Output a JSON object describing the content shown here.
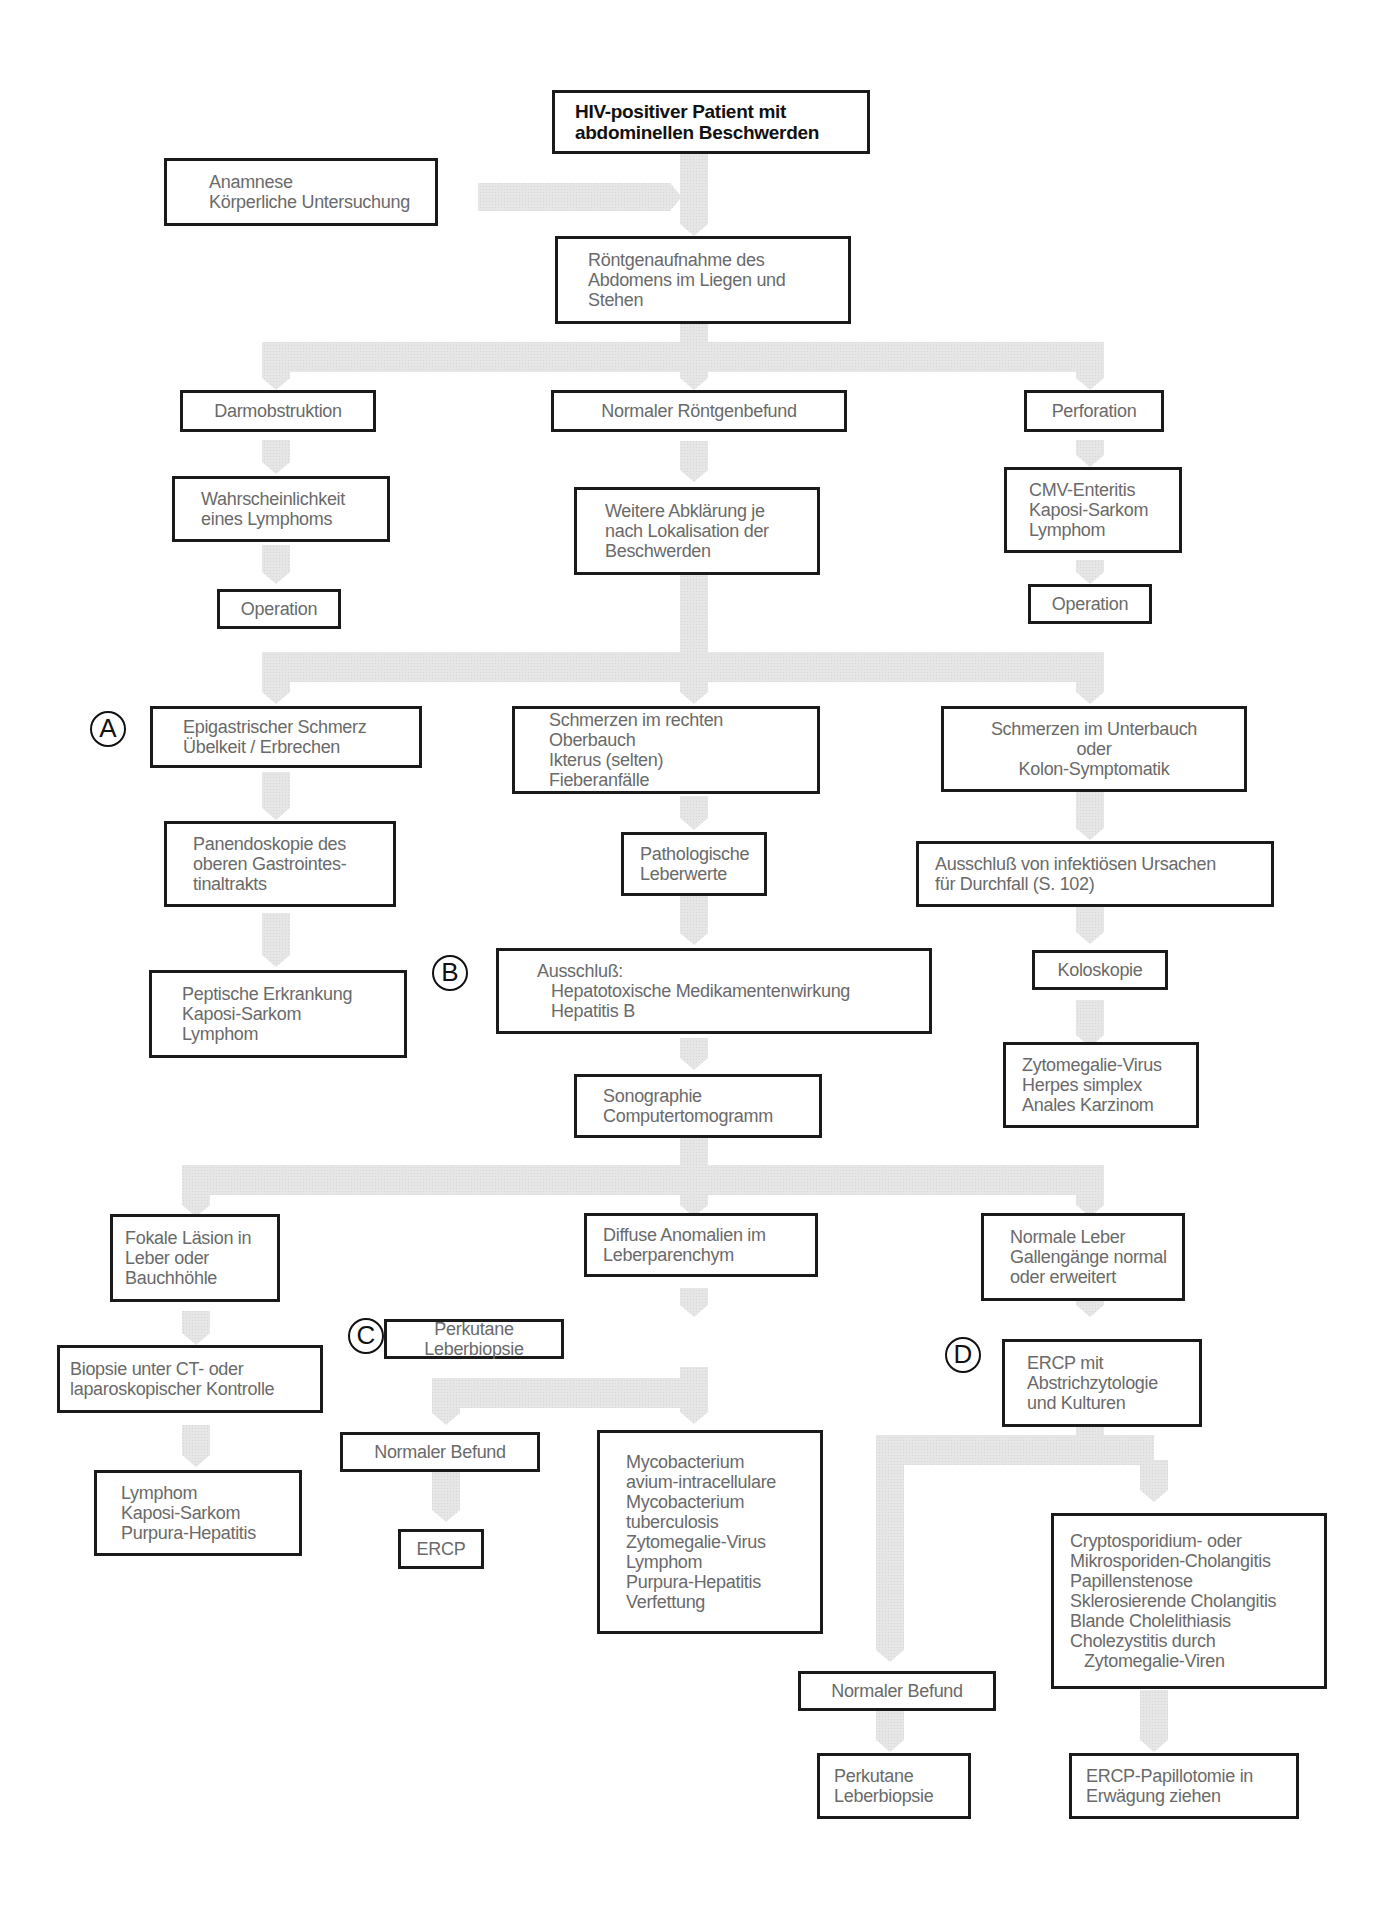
{
  "diagram": {
    "connector_color": "#e3e3e3",
    "border_color": "#1a1a1a",
    "text_color": "#6a6a6a",
    "title": {
      "lines": [
        "HIV-positiver Patient mit",
        "abdominellen Beschwerden"
      ]
    },
    "nodes": {
      "anamnese": {
        "lines": [
          "Anamnese",
          "Körperliche Untersuchung"
        ]
      },
      "roentgen": {
        "lines": [
          "Röntgenaufnahme des",
          "Abdomens im Liegen und",
          "Stehen"
        ]
      },
      "darmobstruktion": {
        "lines": [
          "Darmobstruktion"
        ]
      },
      "normaler_roentgenbefund": {
        "lines": [
          "Normaler Röntgenbefund"
        ]
      },
      "perforation": {
        "lines": [
          "Perforation"
        ]
      },
      "lymphom_wahrscheinlichkeit": {
        "lines": [
          "Wahrscheinlichkeit",
          "eines Lymphoms"
        ]
      },
      "weitere_abklaerung": {
        "lines": [
          "Weitere Abklärung je",
          "nach Lokalisation der",
          "Beschwerden"
        ]
      },
      "cmv_enteritis": {
        "lines": [
          "CMV-Enteritis",
          "Kaposi-Sarkom",
          "Lymphom"
        ]
      },
      "operation_left": {
        "lines": [
          "Operation"
        ]
      },
      "operation_right": {
        "lines": [
          "Operation"
        ]
      },
      "epigastrisch": {
        "lines": [
          "Epigastrischer Schmerz",
          "Übelkeit / Erbrechen"
        ]
      },
      "rechter_oberbauch": {
        "lines": [
          "Schmerzen im rechten Oberbauch",
          "Ikterus (selten)",
          "Fieberanfälle"
        ]
      },
      "unterbauch": {
        "lines": [
          "Schmerzen im Unterbauch",
          "oder",
          "Kolon-Symptomatik"
        ]
      },
      "panendoskopie": {
        "lines": [
          "Panendoskopie des",
          "oberen Gastrointes-",
          "tinaltrakts"
        ]
      },
      "pathologische_leberwerte": {
        "lines": [
          "Pathologische",
          "Leberwerte"
        ]
      },
      "ausschluss_infektioes": {
        "lines": [
          "Ausschluß von infektiösen Ursachen",
          "für Durchfall (S. 102)"
        ]
      },
      "peptische": {
        "lines": [
          "Peptische Erkrankung",
          "Kaposi-Sarkom",
          "Lymphom"
        ]
      },
      "ausschluss_hepato": {
        "lines": [
          "Ausschluß:",
          "   Hepatotoxische Medikamentenwirkung",
          "   Hepatitis B"
        ]
      },
      "koloskopie": {
        "lines": [
          "Koloskopie"
        ]
      },
      "zytomegalie_kolon": {
        "lines": [
          "Zytomegalie-Virus",
          "Herpes simplex",
          "Anales Karzinom"
        ]
      },
      "sonographie": {
        "lines": [
          "Sonographie",
          "Computertomogramm"
        ]
      },
      "fokale_laesion": {
        "lines": [
          "Fokale Läsion in",
          "Leber oder",
          "Bauchhöhle"
        ]
      },
      "diffuse_anomalien": {
        "lines": [
          "Diffuse Anomalien im",
          "Leberparenchym"
        ]
      },
      "normale_leber": {
        "lines": [
          "Normale Leber",
          "Gallengänge normal",
          "oder erweitert"
        ]
      },
      "biopsie_ct": {
        "lines": [
          "Biopsie unter CT- oder",
          "laparoskopischer Kontrolle"
        ]
      },
      "perkutane_biopsie_c": {
        "lines": [
          "Perkutane Leberbiopsie"
        ]
      },
      "ercp_abstrich": {
        "lines": [
          "ERCP mit",
          "Abstrichzytologie",
          "und Kulturen"
        ]
      },
      "lymphom_fokal": {
        "lines": [
          "Lymphom",
          "Kaposi-Sarkom",
          "Purpura-Hepatitis"
        ]
      },
      "normaler_befund_c": {
        "lines": [
          "Normaler Befund"
        ]
      },
      "mycobacterium": {
        "lines": [
          "Mycobacterium",
          "avium-intracellulare",
          "Mycobacterium",
          "tuberculosis",
          "Zytomegalie-Virus",
          "Lymphom",
          "Purpura-Hepatitis",
          "Verfettung"
        ]
      },
      "ercp_c": {
        "lines": [
          "ERCP"
        ]
      },
      "cryptosporidium": {
        "lines": [
          "Cryptosporidium- oder",
          "Mikrosporiden-Cholangitis",
          "Papillenstenose",
          "Sklerosierende Cholangitis",
          "Blande Cholelithiasis",
          "Cholezystitis durch",
          "   Zytomegalie-Viren"
        ]
      },
      "normaler_befund_d": {
        "lines": [
          "Normaler Befund"
        ]
      },
      "perkutane_biopsie_d": {
        "lines": [
          "Perkutane",
          "Leberbiopsie"
        ]
      },
      "ercp_papillotomie": {
        "lines": [
          "ERCP-Papillotomie in",
          "Erwägung ziehen"
        ]
      }
    },
    "markers": {
      "a": "A",
      "b": "B",
      "c": "C",
      "d": "D"
    }
  }
}
